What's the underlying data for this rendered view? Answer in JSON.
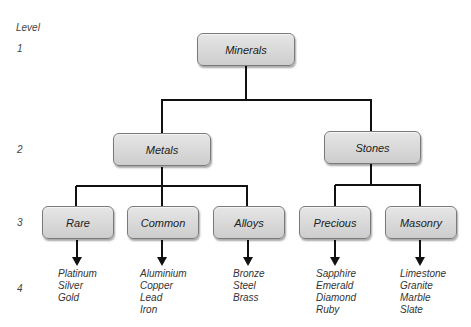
{
  "levels": {
    "heading": "Level",
    "labels": [
      "1",
      "2",
      "3",
      "4"
    ]
  },
  "tree": {
    "root": "Minerals",
    "level2": [
      "Metals",
      "Stones"
    ],
    "level3": [
      "Rare",
      "Common",
      "Alloys",
      "Precious",
      "Masonry"
    ],
    "leaves": [
      [
        "Platinum",
        "Silver",
        "Gold"
      ],
      [
        "Aluminium",
        "Copper",
        "Lead",
        "Iron"
      ],
      [
        "Bronze",
        "Steel",
        "Brass"
      ],
      [
        "Sapphire",
        "Emerald",
        "Diamond",
        "Ruby"
      ],
      [
        "Limestone",
        "Granite",
        "Marble",
        "Slate"
      ]
    ]
  }
}
